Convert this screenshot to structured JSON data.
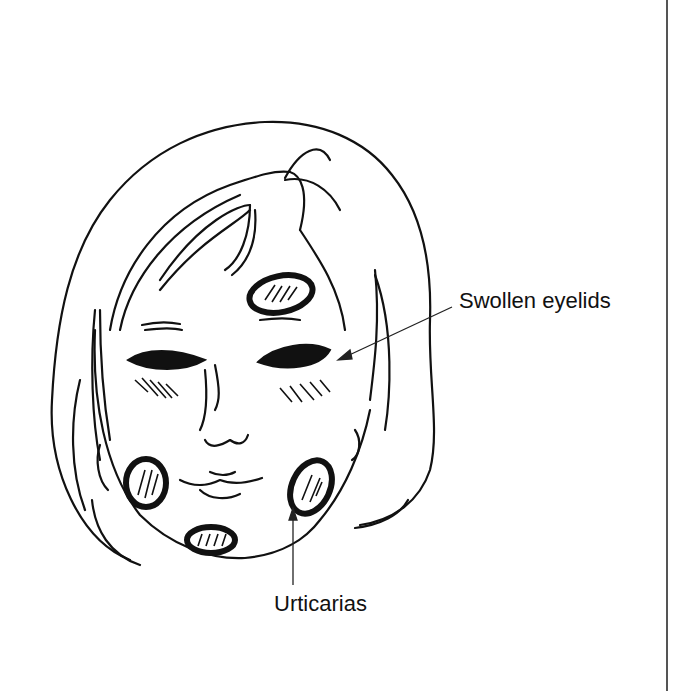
{
  "figure": {
    "annotations": [
      {
        "id": "eyelids",
        "label": "Swollen eyelids"
      },
      {
        "id": "urticarias",
        "label": "Urticarias"
      }
    ]
  },
  "colors": {
    "ink": "#111111",
    "background": "#ffffff",
    "rule": "#555555"
  }
}
